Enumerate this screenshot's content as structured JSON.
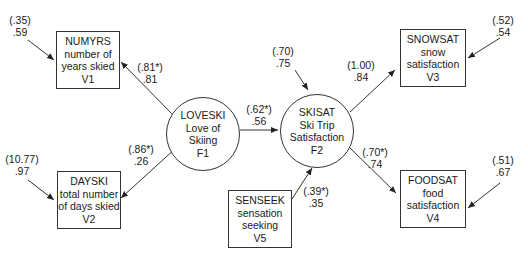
{
  "nodes": {
    "v1": {
      "code": "NUMYRS",
      "line1": "number of",
      "line2": "years skied",
      "id": "V1"
    },
    "v2": {
      "code": "DAYSKI",
      "line1": "total number",
      "line2": "of days skied",
      "id": "V2"
    },
    "v3": {
      "code": "SNOWSAT",
      "line1": "snow",
      "line2": "satisfaction",
      "id": "V3"
    },
    "v4": {
      "code": "FOODSAT",
      "line1": "food",
      "line2": "satisfaction",
      "id": "V4"
    },
    "v5": {
      "code": "SENSEEK",
      "line1": "sensation",
      "line2": "seeking",
      "id": "V5"
    },
    "f1": {
      "code": "LOVESKI",
      "line1": "Love of",
      "line2": "Skiing",
      "id": "F1"
    },
    "f2": {
      "code": "SKISAT",
      "line1": "Ski Trip",
      "line2": "Satisfaction",
      "id": "F2"
    }
  },
  "paths": {
    "e1": {
      "unstd": "(.35)",
      "std": ".59"
    },
    "e2": {
      "unstd": "(10.77)",
      "std": ".97"
    },
    "e3": {
      "unstd": "(.52)",
      "std": ".54"
    },
    "e4": {
      "unstd": "(.51)",
      "std": ".67"
    },
    "d2": {
      "unstd": "(.70)",
      "std": ".75"
    },
    "f1_v1": {
      "unstd": "(.81*)",
      "std": ".81"
    },
    "f1_v2": {
      "unstd": "(.86*)",
      "std": ".26"
    },
    "f1_f2": {
      "unstd": "(.62*)",
      "std": ".56"
    },
    "f2_v3": {
      "unstd": "(1.00)",
      "std": ".84"
    },
    "f2_v4": {
      "unstd": "(.70*)",
      "std": ".74"
    },
    "v5_f2": {
      "unstd": "(.39*)",
      "std": ".35"
    }
  }
}
